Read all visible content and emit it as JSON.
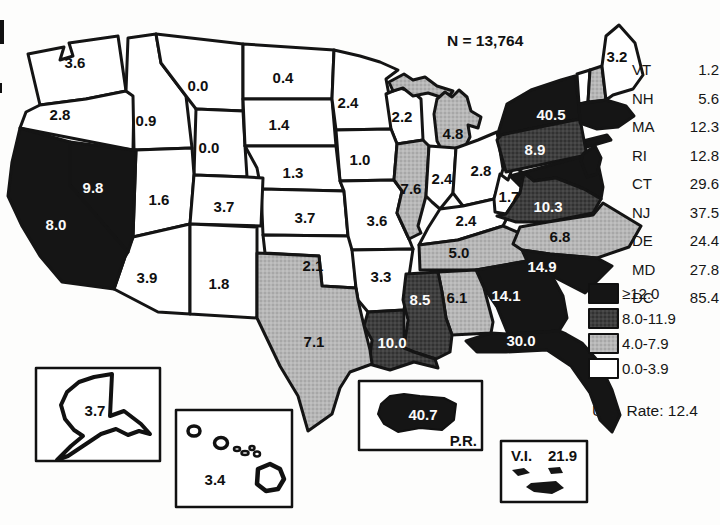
{
  "figure": {
    "n_label": "N = 13,764",
    "us_rate_label": "U.S. Rate: 12.4"
  },
  "legend": {
    "items": [
      {
        "label": "≥12.0",
        "shade": "black",
        "color": "#151515"
      },
      {
        "label": "8.0-11.9",
        "shade": "dark",
        "color": "#3f3f3f"
      },
      {
        "label": "4.0-7.9",
        "shade": "light",
        "color": "#b7b7b7"
      },
      {
        "label": "0.0-3.9",
        "shade": "white",
        "color": "#ffffff"
      }
    ]
  },
  "ne_list": [
    {
      "code": "VT",
      "value": "1.2"
    },
    {
      "code": "NH",
      "value": "5.6"
    },
    {
      "code": "MA",
      "value": "12.3"
    },
    {
      "code": "RI",
      "value": "12.8"
    },
    {
      "code": "CT",
      "value": "29.6"
    },
    {
      "code": "NJ",
      "value": "37.5"
    },
    {
      "code": "DE",
      "value": "24.4"
    },
    {
      "code": "MD",
      "value": "27.8"
    },
    {
      "code": "DC",
      "value": "85.4"
    }
  ],
  "states": {
    "WA": {
      "value": "3.6",
      "shade": "white"
    },
    "OR": {
      "value": "2.8",
      "shade": "white"
    },
    "ID": {
      "value": "0.9",
      "shade": "white"
    },
    "MT": {
      "value": "0.0",
      "shade": "white"
    },
    "WY": {
      "value": "0.0",
      "shade": "white"
    },
    "NV": {
      "value": "9.8",
      "shade": "black"
    },
    "CA": {
      "value": "8.0",
      "shade": "black"
    },
    "UT": {
      "value": "1.6",
      "shade": "white"
    },
    "CO": {
      "value": "3.7",
      "shade": "white"
    },
    "AZ": {
      "value": "3.9",
      "shade": "white"
    },
    "NM": {
      "value": "1.8",
      "shade": "white"
    },
    "ND": {
      "value": "0.4",
      "shade": "white"
    },
    "SD": {
      "value": "1.4",
      "shade": "white"
    },
    "NE": {
      "value": "1.3",
      "shade": "white"
    },
    "KS": {
      "value": "3.7",
      "shade": "white"
    },
    "OK": {
      "value": "2.1",
      "shade": "white"
    },
    "TX": {
      "value": "7.1",
      "shade": "light"
    },
    "MN": {
      "value": "2.4",
      "shade": "white"
    },
    "IA": {
      "value": "1.0",
      "shade": "white"
    },
    "MO": {
      "value": "3.6",
      "shade": "white"
    },
    "AR": {
      "value": "3.3",
      "shade": "white"
    },
    "LA": {
      "value": "10.0",
      "shade": "dark"
    },
    "WI": {
      "value": "2.2",
      "shade": "white"
    },
    "MI": {
      "value": "4.8",
      "shade": "light"
    },
    "IL": {
      "value": "7.6",
      "shade": "light"
    },
    "IN": {
      "value": "2.4",
      "shade": "white"
    },
    "OH": {
      "value": "2.8",
      "shade": "white"
    },
    "KY": {
      "value": "2.4",
      "shade": "white"
    },
    "TN": {
      "value": "5.0",
      "shade": "light"
    },
    "MS": {
      "value": "8.5",
      "shade": "dark"
    },
    "AL": {
      "value": "6.1",
      "shade": "light"
    },
    "GA": {
      "value": "14.1",
      "shade": "black"
    },
    "FL": {
      "value": "30.0",
      "shade": "black"
    },
    "SC": {
      "value": "14.9",
      "shade": "black"
    },
    "NC": {
      "value": "6.8",
      "shade": "light"
    },
    "VA": {
      "value": "10.3",
      "shade": "dark"
    },
    "WV": {
      "value": "1.7",
      "shade": "white"
    },
    "PA": {
      "value": "8.9",
      "shade": "dark"
    },
    "NY": {
      "value": "40.5",
      "shade": "black"
    },
    "ME": {
      "value": "3.2",
      "shade": "white"
    },
    "VT_shape": {
      "shade": "white"
    },
    "NH_shape": {
      "shade": "light"
    },
    "MA_RI_CT": {
      "shade": "black"
    },
    "NJ": {
      "shade": "black"
    },
    "MD_DE": {
      "shade": "black"
    }
  },
  "insets": {
    "AK": {
      "value": "3.7",
      "shade": "white"
    },
    "HI": {
      "value": "3.4",
      "shade": "white"
    },
    "PR": {
      "value": "40.7",
      "label": "P.R.",
      "shade": "black"
    },
    "VI": {
      "value": "21.9",
      "label": "V.I.",
      "shade": "black"
    }
  }
}
